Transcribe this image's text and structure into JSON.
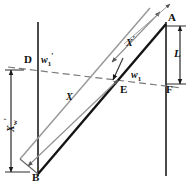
{
  "figure": {
    "type": "geometry-diagram",
    "width": 191,
    "height": 188,
    "background": "#ffffff",
    "ink_color": "#1a1a1a",
    "secondary_color": "#6f6f6f"
  },
  "points": [
    {
      "id": "A",
      "label": "A",
      "x": 172,
      "y": 20
    },
    {
      "id": "B",
      "label": "B",
      "x": 34,
      "y": 174
    },
    {
      "id": "D",
      "label": "D",
      "x": 31,
      "y": 61
    },
    {
      "id": "E",
      "label": "E",
      "x": 122,
      "y": 84
    },
    {
      "id": "F",
      "label": "F",
      "x": 170,
      "y": 86
    }
  ],
  "dimensions": [
    {
      "id": "L",
      "label": "L",
      "sub": "",
      "prime": false,
      "orientation": "vertical",
      "side": "right",
      "from": "A",
      "to": "F"
    },
    {
      "id": "Xw",
      "label": "X",
      "sub": "w",
      "prime": true,
      "orientation": "vertical",
      "side": "left",
      "from": "D-level",
      "to": "B-level"
    },
    {
      "id": "X",
      "label": "X",
      "sub": "",
      "prime": false,
      "orientation": "diagonal",
      "side": "lower",
      "from": "B",
      "to": "E"
    },
    {
      "id": "Xe",
      "label": "X",
      "sub": "",
      "prime": true,
      "orientation": "diagonal",
      "side": "upper",
      "from": "E",
      "to": "A"
    }
  ],
  "beam_waists": [
    {
      "id": "w1prime",
      "label": "w",
      "sub": "1",
      "prime": true,
      "near_point": "D"
    },
    {
      "id": "w1",
      "label": "w",
      "sub": "1",
      "prime": false,
      "near_point": "E"
    }
  ],
  "lines": [
    {
      "id": "left-vertical",
      "style": "solid",
      "color": "#2a2a2a"
    },
    {
      "id": "right-vertical",
      "style": "solid",
      "color": "#2a2a2a"
    },
    {
      "id": "d-e-f-axis",
      "style": "dashed",
      "color": "#6f6f6f"
    },
    {
      "id": "b-a-main-ray",
      "style": "solid",
      "color": "#1a1a1a"
    },
    {
      "id": "b-a-second-ray",
      "style": "solid",
      "color": "#8a8a8a"
    }
  ]
}
